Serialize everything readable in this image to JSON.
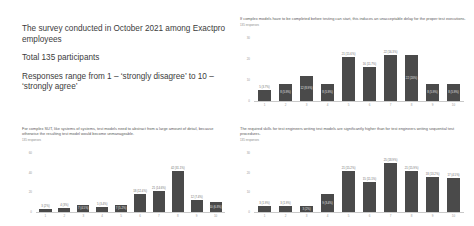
{
  "intro": {
    "lines": [
      "The survey conducted in October 2021 among Exactpro employees",
      "Total 135 participants",
      "Responses range from 1 – ‘strongly disagree’ to 10 – ‘strongly agree’"
    ]
  },
  "responses_note": "135 responses",
  "accent": "#4a4a4a",
  "chart_data": [
    {
      "id": "chart-top-right",
      "type": "bar",
      "title": "If complex models have to be completed before testing can start, this induces an unacceptable delay for the proper test executions.",
      "subtitle": "135 responses",
      "xlabel": "",
      "ylabel": "",
      "ylim": [
        0,
        30
      ],
      "yticks": [
        0,
        10,
        20,
        30
      ],
      "grid": false,
      "legend": "none",
      "categories": [
        "1",
        "2",
        "3",
        "4",
        "5",
        "6",
        "7",
        "8",
        "9",
        "10"
      ],
      "values": [
        5,
        8,
        12,
        8,
        21,
        16,
        22,
        22,
        8,
        8
      ],
      "labels": [
        "5 (3.7%)",
        "8 (5.9%)",
        "12 (8.9%)",
        "8 (5.9%)",
        "21 (15.6%)",
        "16 (11.7%)",
        "22 (16.3%)",
        "22 (20%)",
        "8 (5.9%)",
        "8 (5.9%)"
      ],
      "label_inside": [
        false,
        true,
        true,
        true,
        false,
        false,
        false,
        true,
        true,
        true
      ]
    },
    {
      "id": "chart-bottom-left",
      "type": "bar",
      "title": "For complex SUT, like systems of systems, test models need to abstract from a large amount of detail, because otherwise the resulting test model would become unmanageable.",
      "subtitle": "135 responses",
      "xlabel": "",
      "ylabel": "",
      "ylim": [
        0,
        60
      ],
      "yticks": [
        0,
        20,
        40,
        60
      ],
      "grid": false,
      "legend": "none",
      "categories": [
        "1",
        "2",
        "3",
        "4",
        "5",
        "6",
        "7",
        "8",
        "9",
        "10"
      ],
      "values": [
        3,
        4,
        7,
        5,
        7,
        18,
        21,
        42,
        12,
        10
      ],
      "labels": [
        "3 (2%)",
        "4 (3%)",
        "7 (4.5%)",
        "5 (3.4%)",
        "7 (5.2%)",
        "18 (12.4%)",
        "21 (14.6%)",
        "42 (31.1%)",
        "12 (7.4%)",
        "10 (6.8%)"
      ],
      "label_inside": [
        false,
        false,
        true,
        false,
        true,
        false,
        false,
        false,
        false,
        true
      ]
    },
    {
      "id": "chart-bottom-right",
      "type": "bar",
      "title": "The required skills for test engineers writing test models are significantly higher than for test engineers writing sequential test procedures.",
      "subtitle": "135 responses",
      "xlabel": "",
      "ylabel": "",
      "ylim": [
        0,
        30
      ],
      "yticks": [
        0,
        10,
        20,
        30
      ],
      "grid": false,
      "legend": "none",
      "categories": [
        "1",
        "2",
        "3",
        "4",
        "5",
        "6",
        "7",
        "8",
        "9",
        "10"
      ],
      "values": [
        3,
        3,
        3,
        9,
        21,
        15,
        25,
        21,
        18,
        17
      ],
      "labels": [
        "3 (1.9%)",
        "3 (1.9%)",
        "3 (2%)",
        "9 (3.4%)",
        "21 (15.2%)",
        "15 (11.1%)",
        "25 (18.9%)",
        "21 (15.9%)",
        "18 (13.2%)",
        "17 (4.5%)"
      ],
      "label_inside": [
        false,
        false,
        true,
        true,
        false,
        false,
        false,
        false,
        false,
        false
      ]
    }
  ]
}
